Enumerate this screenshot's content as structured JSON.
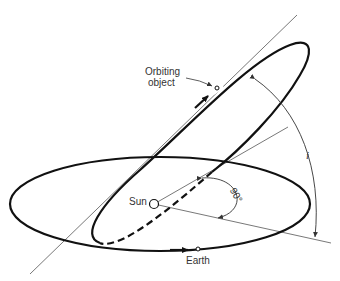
{
  "diagram": {
    "labels": {
      "orbiting_object_line1": "Orbiting",
      "orbiting_object_line2": "object",
      "sun": "Sun",
      "earth": "Earth",
      "right_angle": "90°",
      "inclination": "i"
    },
    "colors": {
      "stroke": "#111111",
      "thin_line": "#555555",
      "background": "#ffffff"
    }
  }
}
